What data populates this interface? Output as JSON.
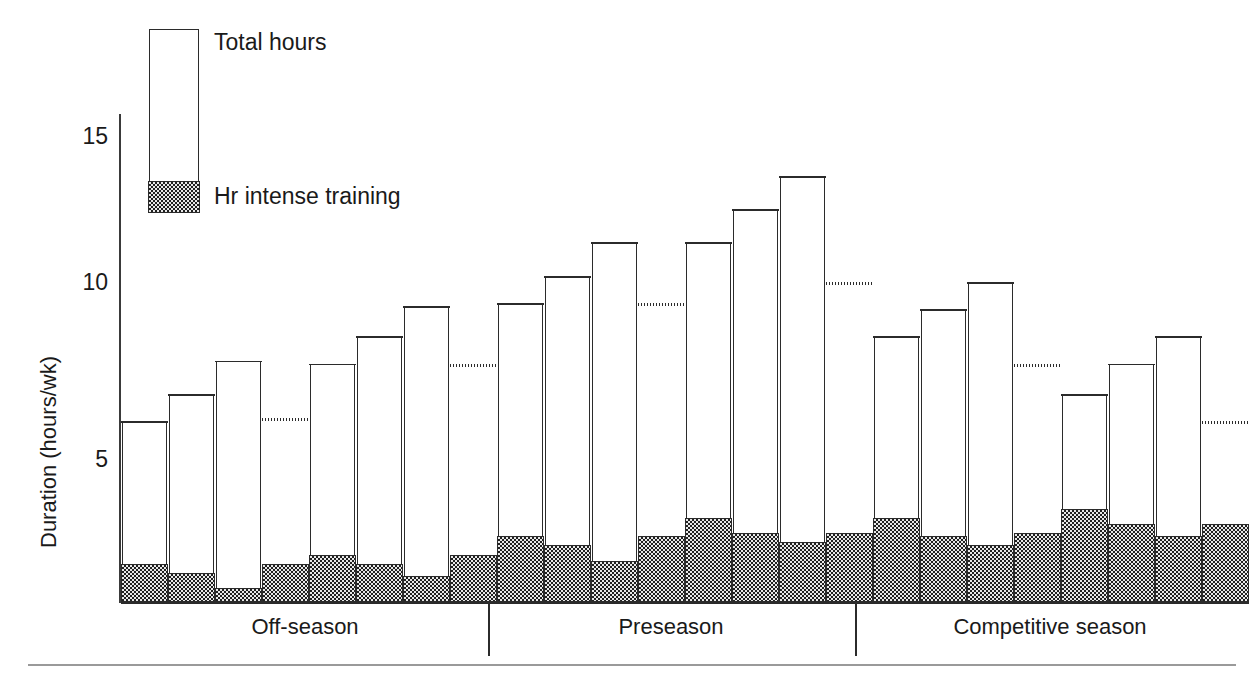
{
  "axis": {
    "y_title": "Duration (hours/wk)",
    "y_ticks": [
      {
        "label": "15",
        "value": 15
      },
      {
        "label": "10",
        "value": 10
      },
      {
        "label": "5",
        "value": 5
      }
    ]
  },
  "legend": {
    "total_label": "Total hours",
    "intense_label": "Hr intense training"
  },
  "seasons": [
    {
      "label": "Off-season"
    },
    {
      "label": "Preseason"
    },
    {
      "label": "Competitive season"
    }
  ],
  "chart_data": {
    "type": "bar",
    "title": "",
    "xlabel": "",
    "ylabel": "Duration (hours/wk)",
    "ylim": [
      0,
      16.5
    ],
    "grid": false,
    "legend_position": "top-left",
    "stacked": true,
    "categories": [
      "Off-season 1",
      "Off-season 2",
      "Off-season 3",
      "Off-season 4",
      "Off-season 5",
      "Off-season 6",
      "Off-season 7",
      "Off-season 8",
      "Preseason 1",
      "Preseason 2",
      "Preseason 3",
      "Preseason 4",
      "Preseason 5",
      "Preseason 6",
      "Preseason 7",
      "Preseason 8",
      "Competitive 1",
      "Competitive 2",
      "Competitive 3",
      "Competitive 4",
      "Competitive 5",
      "Competitive 6",
      "Competitive 7",
      "Competitive 8"
    ],
    "series": [
      {
        "name": "Total hours",
        "values": [
          6.0,
          6.9,
          8.0,
          6.1,
          7.9,
          8.8,
          9.8,
          7.9,
          9.9,
          10.8,
          11.9,
          9.9,
          11.9,
          13.0,
          14.1,
          10.6,
          8.8,
          9.7,
          10.6,
          7.9,
          6.9,
          7.9,
          8.8,
          6.0
        ]
      },
      {
        "name": "Hr intense training",
        "values": [
          1.3,
          1.0,
          0.5,
          1.3,
          1.6,
          1.3,
          0.9,
          1.6,
          2.2,
          1.9,
          1.4,
          2.2,
          2.8,
          2.3,
          2.0,
          2.3,
          2.8,
          2.2,
          1.9,
          2.3,
          3.1,
          2.6,
          2.2,
          2.6
        ]
      }
    ],
    "top_style": [
      "solid",
      "solid",
      "solid",
      "dotted",
      "solid",
      "solid",
      "solid",
      "dotted",
      "solid",
      "solid",
      "solid",
      "dotted",
      "solid",
      "solid",
      "solid",
      "dotted",
      "solid",
      "solid",
      "solid",
      "dotted",
      "solid",
      "solid",
      "solid",
      "dotted"
    ],
    "group_boundaries": [
      8,
      16
    ]
  },
  "render": {
    "baseline_y": 603,
    "px_per_unit": 30.3,
    "plot_left": 121,
    "bar_pitch": 47.0,
    "bar_width": 45.2,
    "divider_x": [
      488,
      855
    ],
    "season_centers": [
      305,
      671,
      1050
    ],
    "tick_y": {
      "15": 137,
      "10": 283,
      "5": 460
    }
  }
}
